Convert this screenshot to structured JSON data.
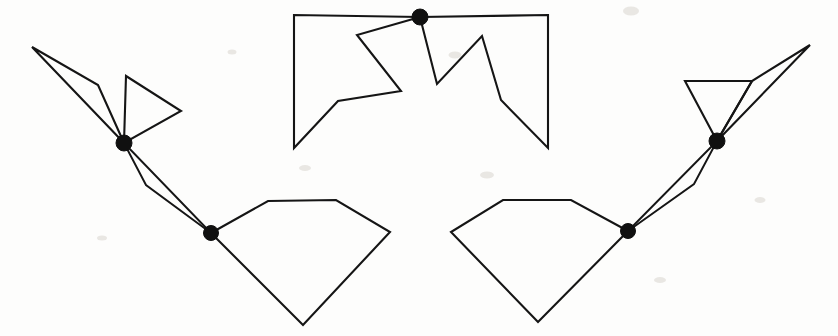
{
  "figure": {
    "canvas": {
      "width": 838,
      "height": 336,
      "background": "#fdfdfc"
    },
    "style": {
      "stroke_color": "#151515",
      "stroke_width": 2.1,
      "node_fill": "#101010",
      "node_radius": 7.5
    },
    "nodes": [
      {
        "id": "node-left-upper",
        "label": "left upper junction",
        "x": 124,
        "y": 143,
        "r": 8.0
      },
      {
        "id": "node-left-lower",
        "label": "left lower junction",
        "x": 211,
        "y": 233,
        "r": 7.5
      },
      {
        "id": "node-top-center",
        "label": "top center junction",
        "x": 420,
        "y": 17,
        "r": 8.0
      },
      {
        "id": "node-right-upper",
        "label": "right upper junction",
        "x": 717,
        "y": 141,
        "r": 8.0
      },
      {
        "id": "node-right-lower",
        "label": "right lower junction",
        "x": 628,
        "y": 231,
        "r": 7.5
      }
    ],
    "shapes": [
      {
        "id": "shape-left-sliver",
        "label": "left upper narrow sliver",
        "closed": true,
        "points": [
          [
            124,
            143
          ],
          [
            32,
            47
          ],
          [
            98,
            85
          ]
        ]
      },
      {
        "id": "shape-left-triangle",
        "label": "left upper triangle",
        "closed": true,
        "points": [
          [
            124,
            143
          ],
          [
            126,
            76
          ],
          [
            181,
            111
          ]
        ]
      },
      {
        "id": "shape-center-left",
        "label": "center left zigzag polygon",
        "closed": true,
        "points": [
          [
            420,
            17
          ],
          [
            294,
            15
          ],
          [
            294,
            148
          ],
          [
            338,
            101
          ],
          [
            401,
            91
          ],
          [
            357,
            35
          ]
        ]
      },
      {
        "id": "shape-center-right",
        "label": "center right zigzag polygon",
        "closed": true,
        "points": [
          [
            420,
            17
          ],
          [
            548,
            15
          ],
          [
            548,
            148
          ],
          [
            501,
            100
          ],
          [
            482,
            36
          ],
          [
            437,
            84
          ]
        ]
      },
      {
        "id": "shape-left-pentagon",
        "label": "lower left pentagon",
        "closed": true,
        "points": [
          [
            211,
            233
          ],
          [
            268,
            201
          ],
          [
            336,
            200
          ],
          [
            390,
            232
          ],
          [
            303,
            325
          ]
        ]
      },
      {
        "id": "shape-right-pentagon",
        "label": "lower right pentagon",
        "closed": true,
        "points": [
          [
            628,
            231
          ],
          [
            571,
            200
          ],
          [
            503,
            200
          ],
          [
            451,
            232
          ],
          [
            538,
            322
          ]
        ]
      },
      {
        "id": "shape-right-sliver",
        "label": "right upper narrow sliver",
        "closed": true,
        "points": [
          [
            717,
            141
          ],
          [
            810,
            45
          ],
          [
            752,
            81
          ]
        ]
      },
      {
        "id": "shape-right-triangle",
        "label": "right upper triangle",
        "closed": true,
        "points": [
          [
            717,
            141
          ],
          [
            685,
            81
          ],
          [
            752,
            81
          ]
        ]
      },
      {
        "id": "connector-left-pair",
        "label": "left node-to-node connector",
        "closed": false,
        "points": [
          [
            124,
            143
          ],
          [
            211,
            233
          ]
        ]
      },
      {
        "id": "connector-left-pair-outer",
        "label": "left node-to-node outer connector",
        "closed": false,
        "points": [
          [
            124,
            143
          ],
          [
            146,
            185
          ],
          [
            211,
            233
          ]
        ]
      },
      {
        "id": "connector-right-pair",
        "label": "right node-to-node connector",
        "closed": false,
        "points": [
          [
            717,
            141
          ],
          [
            628,
            231
          ]
        ]
      },
      {
        "id": "connector-right-pair-outer",
        "label": "right node-to-node outer connector",
        "closed": false,
        "points": [
          [
            717,
            141
          ],
          [
            694,
            184
          ],
          [
            628,
            231
          ]
        ]
      }
    ],
    "specks": [
      {
        "x": 631,
        "y": 11,
        "w": 16,
        "h": 9
      },
      {
        "x": 305,
        "y": 168,
        "w": 12,
        "h": 6
      },
      {
        "x": 487,
        "y": 175,
        "w": 14,
        "h": 7
      },
      {
        "x": 102,
        "y": 238,
        "w": 10,
        "h": 5
      },
      {
        "x": 760,
        "y": 200,
        "w": 11,
        "h": 6
      },
      {
        "x": 455,
        "y": 55,
        "w": 13,
        "h": 7
      },
      {
        "x": 232,
        "y": 52,
        "w": 9,
        "h": 5
      },
      {
        "x": 660,
        "y": 280,
        "w": 12,
        "h": 6
      }
    ]
  }
}
